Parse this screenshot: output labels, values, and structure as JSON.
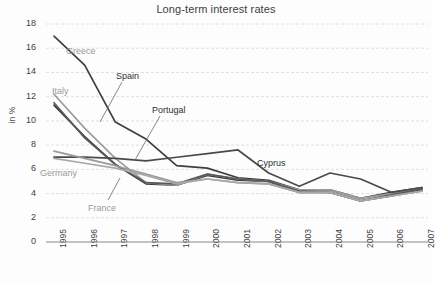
{
  "chart_data": {
    "type": "line",
    "title": "Long-term interest rates",
    "xlabel": "",
    "ylabel": "in %",
    "ylim": [
      0,
      18
    ],
    "ytick_step": 2,
    "grid": true,
    "legend_position": "inline-annotations",
    "x": [
      "1995",
      "1996",
      "1997",
      "1998",
      "1999",
      "2000",
      "2001",
      "2002",
      "2003",
      "2004",
      "2005",
      "2006",
      "2007"
    ],
    "yticks": [
      "0",
      "2",
      "4",
      "6",
      "8",
      "10",
      "12",
      "14",
      "16",
      "18"
    ],
    "series": [
      {
        "name": "Greece",
        "color": "#3f3f3f",
        "values": [
          17.0,
          14.6,
          9.9,
          8.5,
          6.3,
          6.1,
          5.3,
          5.1,
          4.3,
          4.3,
          3.6,
          4.1,
          4.5
        ]
      },
      {
        "name": "Spain",
        "color": "#3a3a3a",
        "values": [
          11.3,
          8.7,
          6.4,
          4.8,
          4.7,
          5.5,
          5.1,
          5.0,
          4.1,
          4.1,
          3.4,
          3.8,
          4.3
        ]
      },
      {
        "name": "Italy",
        "color": "#9c9c9c",
        "values": [
          12.2,
          9.4,
          6.9,
          4.9,
          4.7,
          5.6,
          5.2,
          5.0,
          4.3,
          4.3,
          3.6,
          4.0,
          4.5
        ]
      },
      {
        "name": "Portugal",
        "color": "#5a5a5a",
        "values": [
          11.5,
          8.6,
          6.4,
          4.9,
          4.8,
          5.6,
          5.2,
          5.0,
          4.2,
          4.1,
          3.4,
          3.9,
          4.4
        ]
      },
      {
        "name": "Cyprus",
        "color": "#4a4a4a",
        "values": [
          7.0,
          7.0,
          6.9,
          6.7,
          7.0,
          7.3,
          7.6,
          5.7,
          4.6,
          5.7,
          5.2,
          4.1,
          4.5
        ]
      },
      {
        "name": "Germany",
        "color": "#9a9a9a",
        "values": [
          7.5,
          6.9,
          6.3,
          5.6,
          4.9,
          5.2,
          4.9,
          4.8,
          4.1,
          4.1,
          3.4,
          3.8,
          4.2
        ]
      },
      {
        "name": "France",
        "color": "#a8a8a8",
        "values": [
          6.9,
          6.5,
          6.1,
          5.5,
          4.8,
          5.2,
          4.9,
          4.8,
          4.1,
          4.1,
          3.4,
          3.8,
          4.2
        ]
      }
    ],
    "annotations": [
      {
        "label": "Greece",
        "x": 66,
        "y": 46,
        "tone": "gray"
      },
      {
        "label": "Spain",
        "x": 116,
        "y": 71,
        "tone": "dark"
      },
      {
        "label": "Italy",
        "x": 52,
        "y": 86,
        "tone": "gray"
      },
      {
        "label": "Portugal",
        "x": 152,
        "y": 105,
        "tone": "dark"
      },
      {
        "label": "Cyprus",
        "x": 257,
        "y": 158,
        "tone": "dark"
      },
      {
        "label": "Germany",
        "x": 40,
        "y": 168,
        "tone": "gray"
      },
      {
        "label": "France",
        "x": 88,
        "y": 203,
        "tone": "gray"
      }
    ]
  }
}
